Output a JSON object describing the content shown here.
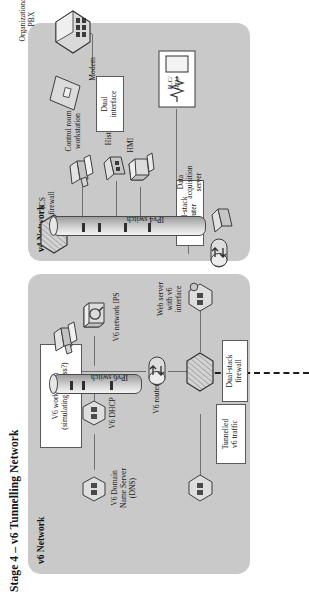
{
  "figure": {
    "title": "Stage 4 – v6 Tunnelling Network",
    "orientation": "rotated-90",
    "panel_fill": "#c9c9c9",
    "page_bg": "#ffffff"
  },
  "panels": [
    {
      "id": "v6",
      "label": "v6 Network"
    },
    {
      "id": "v4",
      "label": "v4 Network"
    }
  ],
  "v6_network": {
    "label": "v6 Network",
    "nodes": [
      {
        "name": "v6-workstation",
        "label": "V6 workstation\n(simulating wireless?)",
        "style": "callout",
        "icon": "workstation-icon"
      },
      {
        "name": "v6-dhcp",
        "label": "V6 DHCP",
        "style": "plain",
        "icon": "server-hex-icon"
      },
      {
        "name": "v6-dns",
        "label": "V6 Domain\nName Server\n(DNS)",
        "style": "plain",
        "icon": "server-hex-icon"
      },
      {
        "name": "ipv6-switch",
        "label": "IPv6 switch",
        "style": "plain",
        "icon": "switch-cylinder-icon"
      },
      {
        "name": "v6-network-ips",
        "label": "V6 network IPS",
        "style": "plain",
        "icon": "ips-box-icon"
      },
      {
        "name": "v6-router",
        "label": "V6 router",
        "style": "plain",
        "icon": "router-icon"
      },
      {
        "name": "web-server-v6",
        "label": "Web server\nwith v6\ninterface",
        "style": "plain",
        "icon": "server-hex-icon"
      },
      {
        "name": "dual-stack-firewall",
        "label": "Dual-stack\nfirewall",
        "style": "callout",
        "icon": "firewall-hex-icon"
      },
      {
        "name": "tunnelled-v6-traffic",
        "label": "Tunnelled\nv6 traffic",
        "style": "callout",
        "icon": "tunnel-dashed-line"
      }
    ]
  },
  "v4_network": {
    "label": "v4 Network",
    "nodes": [
      {
        "name": "ics-firewall",
        "label": "ICS\nfirewall",
        "style": "plain",
        "icon": "firewall-hex-icon"
      },
      {
        "name": "dual-stack-router",
        "label": "Dual-stack\nrouter",
        "style": "callout",
        "icon": "router-icon"
      },
      {
        "name": "data-acquisition-server",
        "label": "Data\nacquisition\nserver",
        "style": "plain",
        "icon": "server-hex-icon"
      },
      {
        "name": "ipv4-switch",
        "label": "IPv4 switch",
        "style": "plain",
        "icon": "switch-cylinder-icon"
      },
      {
        "name": "hmi",
        "label": "HMI",
        "style": "plain",
        "icon": "hmi-box-icon"
      },
      {
        "name": "plc-rtu",
        "label": "PLC/\nRTU",
        "style": "plain",
        "icon": "plc-rtu-icon"
      },
      {
        "name": "historian",
        "label": "Historian",
        "style": "plain",
        "icon": "server-hex-icon"
      },
      {
        "name": "control-room-workstation",
        "label": "Control room\nworkstation",
        "style": "plain",
        "icon": "workstation-icon"
      },
      {
        "name": "modem",
        "label": "Modem",
        "style": "plain",
        "icon": "modem-diamond-icon"
      },
      {
        "name": "dual-interface",
        "label": "Dual\ninterface",
        "style": "callout",
        "icon": "callout-pointer"
      }
    ]
  },
  "external": {
    "nodes": [
      {
        "name": "organizational-pbx",
        "label": "Organizational\nPBX",
        "style": "plain",
        "icon": "pbx-hex-icon"
      }
    ]
  },
  "plc_rtu_inner": {
    "top_label": "PLC/",
    "bottom_label": "RTU"
  }
}
